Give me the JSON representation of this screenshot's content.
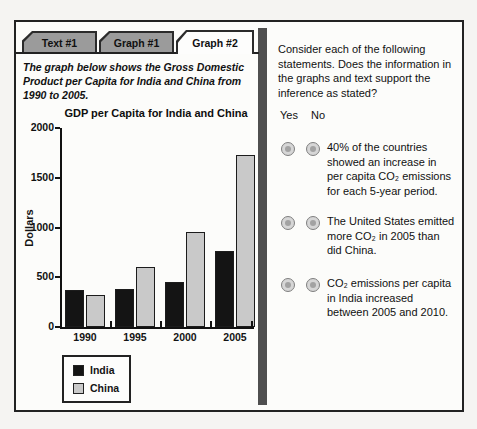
{
  "tabs": [
    {
      "label": "Text #1",
      "active": false
    },
    {
      "label": "Graph #1",
      "active": false
    },
    {
      "label": "Graph #2",
      "active": true
    }
  ],
  "intro": {
    "text": "The graph below shows the Gross Domestic Product per Capita for India and China from 1990 to 2005."
  },
  "chart_data": {
    "type": "bar",
    "title": "GDP per Capita for India and China",
    "xlabel": "",
    "ylabel": "Dollars",
    "categories": [
      "1990",
      "1995",
      "2000",
      "2005"
    ],
    "series": [
      {
        "name": "India",
        "color": "#141414",
        "edge": "#1c1c1c",
        "values": [
          370,
          380,
          450,
          760
        ]
      },
      {
        "name": "China",
        "color": "#c9c9c9",
        "edge": "#1c1c1c",
        "values": [
          320,
          600,
          950,
          1730
        ]
      }
    ],
    "ylim": [
      0,
      2000
    ],
    "yticks": [
      0,
      500,
      1000,
      1500,
      2000
    ],
    "grid": false,
    "legend_position": "bottom-left"
  },
  "question": {
    "prompt": "Consider each of the following statements. Does the information in the graphs and text support the inference as stated?",
    "columns": [
      "Yes",
      "No"
    ],
    "statements": [
      "40% of the countries showed an increase in per capita CO₂ emissions for each 5-year period.",
      "The United States emitted more CO₂ in 2005 than did China.",
      "CO₂ emissions per capita in India increased between 2005 and 2010."
    ]
  },
  "colors": {
    "tab_inactive": "#9b9b9b",
    "tab_active": "#fdfdfc",
    "tab_border": "#2b2b2b",
    "frame_border": "#222222",
    "divider": "#4f4f4f",
    "india_bar": "#141414",
    "china_bar": "#c9c9c9"
  }
}
